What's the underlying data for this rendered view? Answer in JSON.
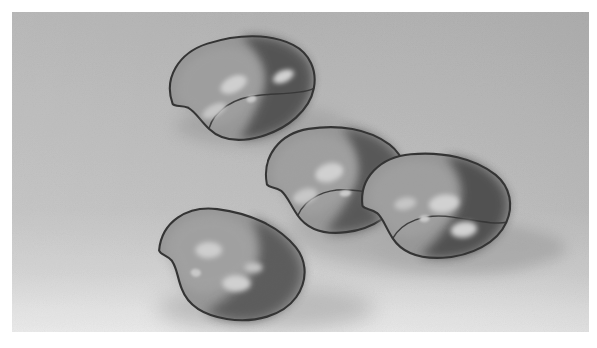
{
  "figure": {
    "caption": ""
  },
  "frame": {
    "margin_left_px": 12,
    "margin_top_px": 12,
    "margin_right_px": 8,
    "margin_bottom_px": 16,
    "frame_color": "#ffffff"
  },
  "scene": {
    "background_top_color": "#bdbdbd",
    "background_mid_color": "#c6c6c6",
    "background_bottom_color": "#f0f0f0",
    "floor_gradient_stop_pct": 82,
    "noise_enabled": true,
    "light_direction": "upper-left",
    "render_style": "smooth-shaded"
  },
  "palette": {
    "outline": "#2e2e2e",
    "body_light": "#9c9c9c",
    "body_mid": "#8a8a8a",
    "body_dark": "#4c4c4c",
    "body_darkest": "#3f3f3f",
    "specular": "#d6d6d6",
    "specular_bright": "#e2e2e2",
    "shadow": "#a8a8a8",
    "shadow_soft": "#b4b4b4"
  },
  "objects": [
    {
      "id": "bean-top-left",
      "name": "Bean top-left",
      "center": [
        243,
        88
      ],
      "width": 148,
      "height": 108,
      "rotation_deg": -16,
      "shadow_center": [
        258,
        128
      ],
      "shadow_rx": 84,
      "shadow_ry": 22,
      "highlights": [
        {
          "cx": 235,
          "cy": 84,
          "rx": 13,
          "ry": 8,
          "intensity": "bright"
        },
        {
          "cx": 210,
          "cy": 103,
          "rx": 12,
          "ry": 6,
          "intensity": "medium"
        },
        {
          "cx": 248,
          "cy": 102,
          "rx": 4,
          "ry": 3,
          "intensity": "small"
        },
        {
          "cx": 284,
          "cy": 90,
          "rx": 10,
          "ry": 6,
          "intensity": "bright"
        }
      ]
    },
    {
      "id": "bean-mid-left",
      "name": "Bean middle-left",
      "center": [
        336,
        180
      ],
      "width": 140,
      "height": 110,
      "rotation_deg": -8,
      "shadow_center": [
        390,
        226
      ],
      "shadow_rx": 132,
      "shadow_ry": 28,
      "highlights": [
        {
          "cx": 329,
          "cy": 175,
          "rx": 14,
          "ry": 9,
          "intensity": "bright"
        },
        {
          "cx": 303,
          "cy": 194,
          "rx": 12,
          "ry": 7,
          "intensity": "medium"
        },
        {
          "cx": 342,
          "cy": 196,
          "rx": 5,
          "ry": 3,
          "intensity": "small"
        }
      ]
    },
    {
      "id": "bean-mid-right",
      "name": "Bean middle-right",
      "center": [
        434,
        205
      ],
      "width": 148,
      "height": 112,
      "rotation_deg": -4,
      "shadow_center": [
        470,
        250
      ],
      "shadow_rx": 110,
      "shadow_ry": 26,
      "highlights": [
        {
          "cx": 446,
          "cy": 207,
          "rx": 14,
          "ry": 9,
          "intensity": "bright"
        },
        {
          "cx": 409,
          "cy": 203,
          "rx": 10,
          "ry": 6,
          "intensity": "medium"
        },
        {
          "cx": 424,
          "cy": 218,
          "rx": 4,
          "ry": 3,
          "intensity": "small"
        },
        {
          "cx": 464,
          "cy": 232,
          "rx": 12,
          "ry": 7,
          "intensity": "bright"
        }
      ]
    },
    {
      "id": "bean-bottom-left",
      "name": "Bean bottom-left",
      "center": [
        230,
        267
      ],
      "width": 150,
      "height": 112,
      "rotation_deg": 8,
      "shadow_center": [
        260,
        310
      ],
      "shadow_rx": 108,
      "shadow_ry": 24,
      "highlights": [
        {
          "cx": 209,
          "cy": 257,
          "rx": 13,
          "ry": 8,
          "intensity": "bright"
        },
        {
          "cx": 254,
          "cy": 268,
          "rx": 9,
          "ry": 5,
          "intensity": "medium"
        },
        {
          "cx": 240,
          "cy": 285,
          "rx": 13,
          "ry": 8,
          "intensity": "bright"
        },
        {
          "cx": 200,
          "cy": 280,
          "rx": 5,
          "ry": 4,
          "intensity": "small"
        }
      ]
    }
  ]
}
